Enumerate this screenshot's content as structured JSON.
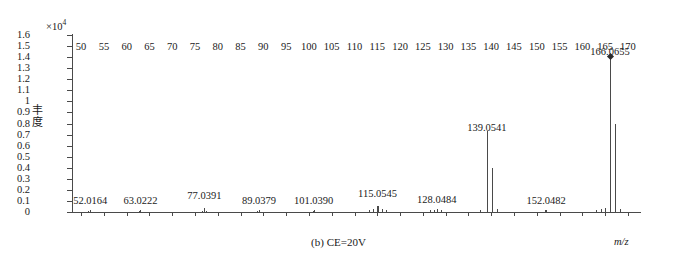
{
  "figure": {
    "caption": "(b) CE=20V",
    "xlabel": "m/z",
    "ylabel_chars": [
      "丰",
      "度"
    ],
    "y_exponent_prefix": "×10",
    "y_exponent_power": "4"
  },
  "chart_data": {
    "type": "bar",
    "title": "(b) CE=20V",
    "subtitle": "",
    "xlabel": "m/z",
    "ylabel": "丰度",
    "y_scale_factor": "×10^4",
    "xlim": [
      48,
      172
    ],
    "ylim": [
      0,
      1.6
    ],
    "grid": false,
    "legend": null,
    "xticks": [
      50,
      55,
      60,
      65,
      70,
      75,
      80,
      85,
      90,
      95,
      100,
      105,
      110,
      115,
      120,
      125,
      130,
      135,
      140,
      145,
      150,
      155,
      160,
      165,
      170
    ],
    "yticks": [
      "0",
      "0.1",
      "0.2",
      "0.3",
      "0.4",
      "0.5",
      "0.6",
      "0.7",
      "0.8",
      "0.9",
      "1",
      "1.1",
      "1.2",
      "1.3",
      "1.4",
      "1.5",
      "1.6"
    ],
    "base_peak_mz": 166.0655,
    "annotations": [
      "52.0164",
      "63.0222",
      "77.0391",
      "89.0379",
      "101.0390",
      "115.0545",
      "128.0484",
      "139.0541",
      "152.0482",
      "166.0655"
    ],
    "labeled_peaks": [
      {
        "mz": 52.0164,
        "label": "52.0164",
        "intensity": 0.02,
        "label_y": 0.155
      },
      {
        "mz": 63.0222,
        "label": "63.0222",
        "intensity": 0.02,
        "label_y": 0.155
      },
      {
        "mz": 77.0391,
        "label": "77.0391",
        "intensity": 0.04,
        "label_y": 0.2
      },
      {
        "mz": 89.0379,
        "label": "89.0379",
        "intensity": 0.02,
        "label_y": 0.155
      },
      {
        "mz": 101.039,
        "label": "101.0390",
        "intensity": 0.02,
        "label_y": 0.155
      },
      {
        "mz": 115.0545,
        "label": "115.0545",
        "intensity": 0.055,
        "label_y": 0.215
      },
      {
        "mz": 128.0484,
        "label": "128.0484",
        "intensity": 0.03,
        "label_y": 0.165
      },
      {
        "mz": 139.0541,
        "label": "139.0541",
        "intensity": 0.73,
        "label_y": 0.815
      },
      {
        "mz": 152.0482,
        "label": "152.0482",
        "intensity": 0.02,
        "label_y": 0.155
      },
      {
        "mz": 166.0655,
        "label": "166.0655",
        "intensity": 1.4,
        "label_y": 1.5
      }
    ],
    "unlabeled_peaks": [
      {
        "mz": 51.5,
        "intensity": 0.012
      },
      {
        "mz": 62.6,
        "intensity": 0.01
      },
      {
        "mz": 76.6,
        "intensity": 0.012
      },
      {
        "mz": 77.5,
        "intensity": 0.01
      },
      {
        "mz": 88.7,
        "intensity": 0.012
      },
      {
        "mz": 100.8,
        "intensity": 0.01
      },
      {
        "mz": 113.2,
        "intensity": 0.02
      },
      {
        "mz": 114.1,
        "intensity": 0.03
      },
      {
        "mz": 115.0,
        "intensity": 0.055
      },
      {
        "mz": 116.1,
        "intensity": 0.025
      },
      {
        "mz": 117.0,
        "intensity": 0.018
      },
      {
        "mz": 126.6,
        "intensity": 0.018
      },
      {
        "mz": 127.4,
        "intensity": 0.022
      },
      {
        "mz": 128.0,
        "intensity": 0.03
      },
      {
        "mz": 129.0,
        "intensity": 0.015
      },
      {
        "mz": 137.6,
        "intensity": 0.018
      },
      {
        "mz": 140.1,
        "intensity": 0.4
      },
      {
        "mz": 141.2,
        "intensity": 0.03
      },
      {
        "mz": 151.8,
        "intensity": 0.014
      },
      {
        "mz": 162.9,
        "intensity": 0.02
      },
      {
        "mz": 164.0,
        "intensity": 0.03
      },
      {
        "mz": 165.0,
        "intensity": 0.035
      },
      {
        "mz": 167.1,
        "intensity": 0.8
      },
      {
        "mz": 168.2,
        "intensity": 0.025
      }
    ]
  }
}
